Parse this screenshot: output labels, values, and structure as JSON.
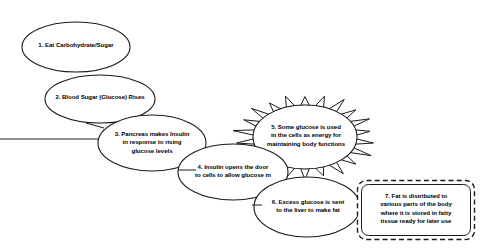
{
  "diagram": {
    "background_color": "#ffffff",
    "stroke_color": "#1a1a1a",
    "fill_color": "#ffffff",
    "text_color": "#000000",
    "nodes": [
      {
        "id": "step-1",
        "order": "1",
        "shape": "ellipse",
        "text": "1. Eat Carbohydrate/Sugar",
        "cx": 76,
        "cy": 47,
        "rx": 54,
        "ry": 25,
        "label_left": 18,
        "label_top": 41,
        "label_width": 116
      },
      {
        "id": "step-2",
        "order": "2",
        "shape": "ellipse",
        "text": "2. Blood Sugar (Glucose) Rises",
        "cx": 100,
        "cy": 99,
        "rx": 55,
        "ry": 24,
        "label_left": 41,
        "label_top": 93,
        "label_width": 118
      },
      {
        "id": "step-3",
        "order": "3",
        "shape": "ellipse",
        "text": "3. Pancreas makes Insulin\nin response to rising\nglucose levels",
        "cx": 152,
        "cy": 143,
        "rx": 54,
        "ry": 28,
        "label_left": 96,
        "label_top": 130,
        "label_width": 112
      },
      {
        "id": "step-4",
        "order": "4",
        "shape": "ellipse",
        "text": "4. Insulin opens the door\nto cells to allow glucose in",
        "cx": 233,
        "cy": 172,
        "rx": 55,
        "ry": 28,
        "label_left": 177,
        "label_top": 163,
        "label_width": 112
      },
      {
        "id": "step-5",
        "order": "5",
        "shape": "starburst",
        "text": "5. Some glucose is used\nin the cells as energy for\nmaintaining body functions",
        "cx": 305,
        "cy": 137,
        "rx": 52,
        "ry": 32,
        "spike_length": 12,
        "spike_count": 22,
        "label_left": 250,
        "label_top": 123,
        "label_width": 112
      },
      {
        "id": "step-6",
        "order": "6",
        "shape": "ellipse",
        "text": "6. Excess glucose is sent\nto the liver to make fat",
        "cx": 307,
        "cy": 207,
        "rx": 53,
        "ry": 30,
        "label_left": 252,
        "label_top": 198,
        "label_width": 112
      },
      {
        "id": "step-7",
        "order": "7",
        "shape": "rounded-rect-dashed",
        "text": "7. Fat is distributed to\nvarious parts of the body\nwhere it is stored in fatty\ntissue ready for later use",
        "x": 357,
        "y": 180,
        "width": 118,
        "height": 60,
        "corner_radius": 9,
        "label_left": 360,
        "label_top": 192,
        "label_width": 112
      }
    ],
    "connectors": [
      {
        "id": "edge-1-2",
        "from": "step-1",
        "to": "step-2"
      },
      {
        "id": "edge-2-3",
        "from": "step-2",
        "to": "step-3"
      },
      {
        "id": "edge-3-4",
        "from": "step-3",
        "to": "step-4"
      },
      {
        "id": "edge-4-5",
        "from": "step-4",
        "to": "step-5"
      },
      {
        "id": "edge-5-6",
        "from": "step-5",
        "to": "step-6"
      },
      {
        "id": "edge-6-7",
        "from": "step-6",
        "to": "step-7"
      }
    ]
  }
}
